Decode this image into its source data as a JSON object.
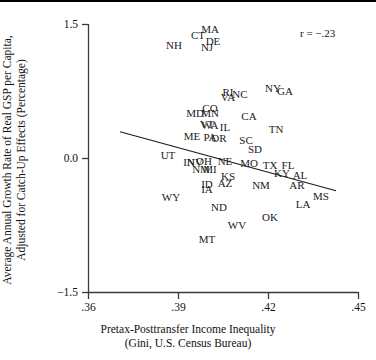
{
  "chart_data": {
    "type": "scatter",
    "title": "",
    "xlabel": "Pretax-Posttransfer Income Inequality (Gini, U.S. Census Bureau)",
    "xlabel_line1": "Pretax-Posttransfer Income Inequality",
    "xlabel_line2": "(Gini, U.S. Census Bureau)",
    "ylabel": "Average Annual Growth Rate of Real GSP per Capita, Adjusted for Catch-Up Effects (Percentage)",
    "ylabel_line1": "Average Annual Growth Rate of Real GSP per Capita,",
    "ylabel_line2": "Adjusted for Catch-Up Effects (Percentage)",
    "xlim": [
      0.36,
      0.45
    ],
    "ylim": [
      -1.5,
      1.5
    ],
    "xticks": [
      0.36,
      0.39,
      0.42,
      0.45
    ],
    "xticklabels": [
      ".36",
      ".39",
      ".42",
      ".45"
    ],
    "yticks": [
      -1.5,
      0.0,
      1.5
    ],
    "yticklabels": [
      "−1.5",
      "0.0",
      "1.5"
    ],
    "grid": false,
    "legend": false,
    "point_marker": "text-label",
    "annotation": "r = −.23",
    "trendline": {
      "x0": 0.3705,
      "y0": 0.3,
      "x1": 0.4425,
      "y1": -0.36
    },
    "points": [
      {
        "label": "MA",
        "x": 0.4005,
        "y": 1.455
      },
      {
        "label": "CT",
        "x": 0.3965,
        "y": 1.385
      },
      {
        "label": "DE",
        "x": 0.4015,
        "y": 1.315
      },
      {
        "label": "NH",
        "x": 0.3885,
        "y": 1.275
      },
      {
        "label": "NJ",
        "x": 0.3995,
        "y": 1.245
      },
      {
        "label": "NY",
        "x": 0.4215,
        "y": 0.795
      },
      {
        "label": "GA",
        "x": 0.4255,
        "y": 0.755
      },
      {
        "label": "RI",
        "x": 0.4065,
        "y": 0.745
      },
      {
        "label": "NC",
        "x": 0.4105,
        "y": 0.725
      },
      {
        "label": "VA",
        "x": 0.4065,
        "y": 0.685
      },
      {
        "label": "CO",
        "x": 0.4005,
        "y": 0.565
      },
      {
        "label": "MN",
        "x": 0.4005,
        "y": 0.515
      },
      {
        "label": "MD",
        "x": 0.3955,
        "y": 0.505
      },
      {
        "label": "CA",
        "x": 0.4135,
        "y": 0.475
      },
      {
        "label": "VT",
        "x": 0.3995,
        "y": 0.385
      },
      {
        "label": "WA",
        "x": 0.4005,
        "y": 0.375
      },
      {
        "label": "IL",
        "x": 0.4055,
        "y": 0.355
      },
      {
        "label": "TN",
        "x": 0.4225,
        "y": 0.335
      },
      {
        "label": "ME",
        "x": 0.3945,
        "y": 0.255
      },
      {
        "label": "PA",
        "x": 0.4005,
        "y": 0.245
      },
      {
        "label": "OR",
        "x": 0.4035,
        "y": 0.225
      },
      {
        "label": "SC",
        "x": 0.4125,
        "y": 0.205
      },
      {
        "label": "SD",
        "x": 0.4155,
        "y": 0.105
      },
      {
        "label": "UT",
        "x": 0.3865,
        "y": 0.035
      },
      {
        "label": "IN",
        "x": 0.3935,
        "y": -0.035
      },
      {
        "label": "NV",
        "x": 0.3955,
        "y": -0.035
      },
      {
        "label": "OH",
        "x": 0.3985,
        "y": -0.025
      },
      {
        "label": "NE",
        "x": 0.4055,
        "y": -0.025
      },
      {
        "label": "MO",
        "x": 0.4135,
        "y": -0.055
      },
      {
        "label": "TX",
        "x": 0.4205,
        "y": -0.075
      },
      {
        "label": "FL",
        "x": 0.4265,
        "y": -0.075
      },
      {
        "label": "NM",
        "x": 0.3975,
        "y": -0.115
      },
      {
        "label": "MI",
        "x": 0.4005,
        "y": -0.115
      },
      {
        "label": "KY",
        "x": 0.4245,
        "y": -0.165
      },
      {
        "label": "AL",
        "x": 0.4305,
        "y": -0.185
      },
      {
        "label": "KS",
        "x": 0.4065,
        "y": -0.195
      },
      {
        "label": "AZ",
        "x": 0.4055,
        "y": -0.275
      },
      {
        "label": "ID",
        "x": 0.3995,
        "y": -0.285
      },
      {
        "label": "NM2",
        "x": 0.4175,
        "y": -0.295
      },
      {
        "label": "AR",
        "x": 0.4295,
        "y": -0.295
      },
      {
        "label": "IA",
        "x": 0.3995,
        "y": -0.345
      },
      {
        "label": "MS",
        "x": 0.4375,
        "y": -0.415
      },
      {
        "label": "WY",
        "x": 0.3875,
        "y": -0.435
      },
      {
        "label": "LA",
        "x": 0.4315,
        "y": -0.505
      },
      {
        "label": "ND",
        "x": 0.4035,
        "y": -0.545
      },
      {
        "label": "OK",
        "x": 0.4205,
        "y": -0.655
      },
      {
        "label": "WV",
        "x": 0.4095,
        "y": -0.745
      },
      {
        "label": "MT",
        "x": 0.3995,
        "y": -0.895
      }
    ]
  }
}
